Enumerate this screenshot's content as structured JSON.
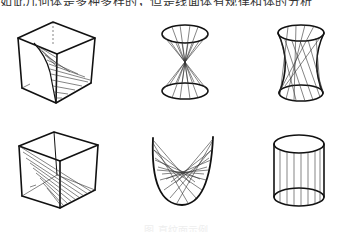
{
  "header": {
    "partial_text": "如此几何体是多种多样的，但是线面体有规律和体的分析"
  },
  "figures": [
    {
      "id": "cube-curved-ruled-surface",
      "label": "Cube with curved ruled surface"
    },
    {
      "id": "double-cone",
      "label": "Double cone"
    },
    {
      "id": "hyperboloid-one-sheet",
      "label": "Hyperboloid of one sheet"
    },
    {
      "id": "cube-diagonal-ruled-plane",
      "label": "Cube with diagonal ruled plane"
    },
    {
      "id": "hyperbolic-paraboloid-saddle",
      "label": "Ruled saddle / parabolic surface"
    },
    {
      "id": "cylinder",
      "label": "Cylinder"
    }
  ],
  "caption": {
    "text": "图 直纹面示例"
  },
  "colors": {
    "ink": "#111111",
    "background": "#ffffff"
  }
}
